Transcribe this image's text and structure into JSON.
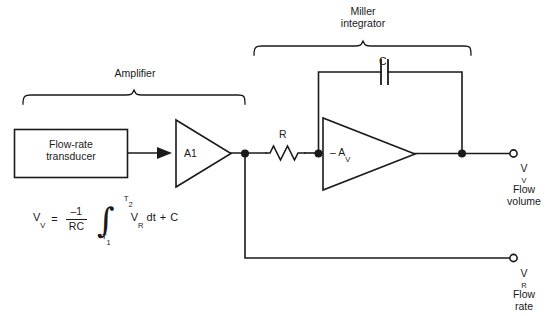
{
  "diagram": {
    "stroke_color": "#1a1a1a",
    "background_color": "#ffffff"
  },
  "blocks": {
    "transducer": {
      "line1": "Flow-rate",
      "line2": "transducer"
    },
    "amplifier_stage": {
      "label": "A1"
    },
    "integrator_opamp": {
      "label": "– A",
      "label_sub": "V"
    }
  },
  "components": {
    "resistor": {
      "label": "R"
    },
    "capacitor": {
      "label": "C"
    }
  },
  "braces": {
    "amplifier": {
      "label": "Amplifier"
    },
    "miller": {
      "line1": "Miller",
      "line2": "integrator"
    }
  },
  "terminals": {
    "flow_volume": {
      "symbol": "V",
      "symbol_sub": "V",
      "line1": "Flow",
      "line2": "volume"
    },
    "flow_rate": {
      "symbol": "V",
      "symbol_sub": "R",
      "line1": "Flow",
      "line2": "rate"
    }
  },
  "formula": {
    "lhs": "V",
    "lhs_sub": "V",
    "equals": "=",
    "frac_num": "–1",
    "frac_den": "RC",
    "integral": "∫",
    "limit_upper": "T",
    "limit_upper_sub": "2",
    "limit_lower": "T",
    "limit_lower_sub": "1",
    "integrand": "V",
    "integrand_sub": "R",
    "differential": "dt",
    "plus": "+",
    "constant": "C"
  }
}
